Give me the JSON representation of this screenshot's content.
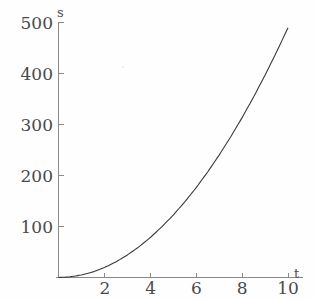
{
  "chart_data": {
    "type": "line",
    "title": "",
    "subtitle": "",
    "xlabel": "t",
    "ylabel": "s",
    "xlim": [
      0,
      10.5
    ],
    "ylim": [
      0,
      500
    ],
    "grid": false,
    "legend": null,
    "x_ticks": [
      2,
      4,
      6,
      8,
      10
    ],
    "x_tick_labels": [
      "2",
      "4",
      "6",
      "8",
      "10"
    ],
    "y_ticks": [
      100,
      200,
      300,
      400,
      500
    ],
    "y_tick_labels": [
      "100",
      "200",
      "300",
      "400",
      "500"
    ],
    "series": [
      {
        "name": "s = 4.9 t^2",
        "color": "#3a3a3a",
        "x": [
          0,
          0.5,
          1,
          1.5,
          2,
          2.5,
          3,
          3.5,
          4,
          4.5,
          5,
          5.5,
          6,
          6.5,
          7,
          7.5,
          8,
          8.5,
          9,
          9.5,
          10
        ],
        "y": [
          0,
          1.2,
          4.9,
          11,
          19.6,
          30.6,
          44.1,
          60,
          78.4,
          99.2,
          122.5,
          148.2,
          176.4,
          207,
          240.1,
          275.6,
          313.6,
          354,
          396.9,
          442.2,
          490
        ]
      }
    ],
    "annotations": []
  },
  "figure": {
    "background_color": "#fefefe",
    "axis_color": "#8a8a8a",
    "text_color": "#4a4a4a",
    "curve_color": "#3a3a3a",
    "x_axis_name": "t",
    "y_axis_name": "s"
  }
}
